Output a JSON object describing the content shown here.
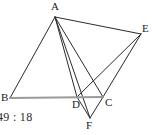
{
  "figure": {
    "caption": "49 : 18",
    "background_color": "#ffffff",
    "stroke_color": "#2b2b2b",
    "baseline_color": "#9a9a9a",
    "stroke_width": 1,
    "baseline_width": 2,
    "points": {
      "A": {
        "label": "A",
        "x": 55,
        "y": 17,
        "label_x": 51,
        "label_y": 1
      },
      "B": {
        "label": "B",
        "x": 10,
        "y": 98,
        "label_x": 1,
        "label_y": 92
      },
      "C": {
        "label": "C",
        "x": 103,
        "y": 97,
        "label_x": 105,
        "label_y": 97
      },
      "D": {
        "label": "D",
        "x": 77,
        "y": 97,
        "label_x": 72,
        "label_y": 99
      },
      "E": {
        "label": "E",
        "x": 141,
        "y": 34,
        "label_x": 142,
        "label_y": 23
      },
      "F": {
        "label": "F",
        "x": 90,
        "y": 118,
        "label_x": 86,
        "label_y": 120
      }
    },
    "segments": [
      {
        "name": "segment-A-B",
        "from": "A",
        "to": "B",
        "style": "dark"
      },
      {
        "name": "segment-A-D",
        "from": "A",
        "to": "D",
        "style": "dark"
      },
      {
        "name": "segment-A-C",
        "from": "A",
        "to": "C",
        "style": "dark"
      },
      {
        "name": "segment-A-F",
        "from": "A",
        "to": "F",
        "style": "dark"
      },
      {
        "name": "segment-A-E",
        "from": "A",
        "to": "E",
        "style": "dark"
      },
      {
        "name": "segment-D-E",
        "from": "D",
        "to": "E",
        "style": "dark"
      },
      {
        "name": "segment-C-E",
        "from": "C",
        "to": "E",
        "style": "dark"
      },
      {
        "name": "segment-D-F",
        "from": "D",
        "to": "F",
        "style": "dark"
      },
      {
        "name": "segment-C-F",
        "from": "C",
        "to": "F",
        "style": "dark"
      },
      {
        "name": "segment-B-C",
        "from": "B",
        "to": "C",
        "style": "baseline"
      }
    ]
  }
}
